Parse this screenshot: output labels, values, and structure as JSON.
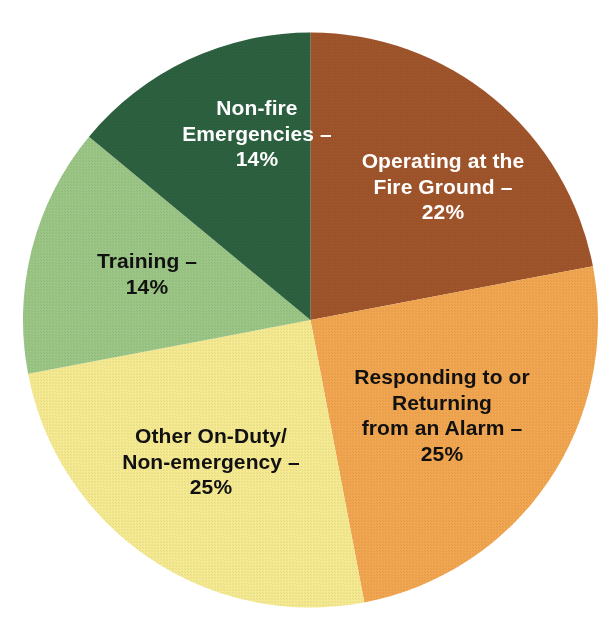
{
  "chart_data": {
    "type": "pie",
    "title": "",
    "subtitle": "",
    "xlabel": "",
    "ylabel": "",
    "legend_position": "none",
    "grid": false,
    "labels_inside_slices": true,
    "start_angle_deg": 0,
    "direction": "clockwise",
    "units": "percent",
    "categories": [
      "Operating at the Fire Ground",
      "Responding to or Returning from an Alarm",
      "Other On-Duty/Non-emergency",
      "Training",
      "Non-fire Emergencies"
    ],
    "values": [
      22,
      25,
      25,
      14,
      14
    ],
    "colors": [
      "#A1552B",
      "#F3A750",
      "#F7EB92",
      "#9DC786",
      "#2C6140"
    ],
    "slices": [
      {
        "name": "operating-at-the-fire-ground",
        "label": "Operating at the\nFire Ground –\n22%",
        "category": "Operating at the Fire Ground",
        "value": 22,
        "value_text": "22%",
        "color": "#A1552B",
        "text_color": "#FFFFFF",
        "start_angle_deg": 0,
        "end_angle_deg": 79.2
      },
      {
        "name": "responding-to-or-returning-from-an-alarm",
        "label": "Responding to or\nReturning\nfrom an Alarm –\n25%",
        "category": "Responding to or Returning from an Alarm",
        "value": 25,
        "value_text": "25%",
        "color": "#F3A750",
        "text_color": "#111111",
        "start_angle_deg": 79.2,
        "end_angle_deg": 169.2
      },
      {
        "name": "other-on-duty-non-emergency",
        "label": "Other On-Duty/\nNon-emergency –\n25%",
        "category": "Other On-Duty/Non-emergency",
        "value": 25,
        "value_text": "25%",
        "color": "#F7EB92",
        "text_color": "#111111",
        "start_angle_deg": 169.2,
        "end_angle_deg": 259.2
      },
      {
        "name": "training",
        "label": "Training –\n14%",
        "category": "Training",
        "value": 14,
        "value_text": "14%",
        "color": "#9DC786",
        "text_color": "#111111",
        "start_angle_deg": 259.2,
        "end_angle_deg": 309.6
      },
      {
        "name": "non-fire-emergencies",
        "label": "Non-fire\nEmergencies –\n14%",
        "category": "Non-fire Emergencies",
        "value": 14,
        "value_text": "14%",
        "color": "#2C6140",
        "text_color": "#FFFFFF",
        "start_angle_deg": 309.6,
        "end_angle_deg": 360
      }
    ]
  },
  "background_color": "#FFFFFF"
}
